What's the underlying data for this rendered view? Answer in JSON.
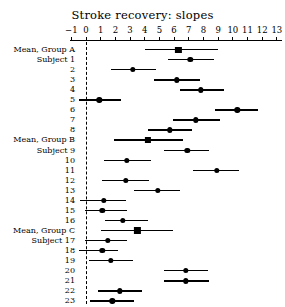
{
  "chart_data": {
    "type": "scatter",
    "title": "Stroke recovery: slopes",
    "subtitle": "",
    "xlabel": "",
    "ylabel": "",
    "xlim": [
      -1.6,
      13.6
    ],
    "xticks": [
      -1,
      0,
      1,
      2,
      3,
      4,
      5,
      6,
      7,
      8,
      9,
      10,
      11,
      12,
      13
    ],
    "xtick_labels": [
      "−1",
      "0",
      "1",
      "2",
      "3",
      "4",
      "5",
      "6",
      "7",
      "8",
      "9",
      "10",
      "11",
      "12",
      "13"
    ],
    "grid": false,
    "legend": false,
    "reference_line": {
      "value": 0,
      "style": "dashed",
      "color": "#000000"
    },
    "marker_colors": {
      "point": "#000000",
      "interval": "#000000"
    },
    "rows": [
      {
        "label": "Mean, Group A",
        "marker": "square",
        "estimate": 6.3,
        "low": 4.0,
        "high": 9.0
      },
      {
        "label": "Subject 1",
        "marker": "circle",
        "estimate": 7.1,
        "low": 5.6,
        "high": 8.7
      },
      {
        "label": "2",
        "marker": "circle",
        "estimate": 3.2,
        "low": 1.7,
        "high": 4.8
      },
      {
        "label": "3",
        "marker": "circle",
        "estimate": 6.2,
        "low": 4.6,
        "high": 7.8
      },
      {
        "label": "4",
        "marker": "circle",
        "estimate": 7.8,
        "low": 6.4,
        "high": 9.4
      },
      {
        "label": "5",
        "marker": "circle",
        "estimate": 0.9,
        "low": -0.5,
        "high": 2.4
      },
      {
        "label": "6",
        "marker": "circle",
        "estimate": 10.3,
        "low": 8.8,
        "high": 11.7
      },
      {
        "label": "7",
        "marker": "circle",
        "estimate": 7.5,
        "low": 5.9,
        "high": 9.1
      },
      {
        "label": "8",
        "marker": "circle",
        "estimate": 5.7,
        "low": 4.2,
        "high": 7.2
      },
      {
        "label": "Mean, Group B",
        "marker": "square",
        "estimate": 4.2,
        "low": 1.9,
        "high": 6.6
      },
      {
        "label": "Subject 9",
        "marker": "circle",
        "estimate": 6.9,
        "low": 5.3,
        "high": 8.4
      },
      {
        "label": "10",
        "marker": "circle",
        "estimate": 2.8,
        "low": 1.2,
        "high": 4.4
      },
      {
        "label": "11",
        "marker": "circle",
        "estimate": 8.9,
        "low": 7.3,
        "high": 10.4
      },
      {
        "label": "12",
        "marker": "circle",
        "estimate": 2.7,
        "low": 1.1,
        "high": 4.3
      },
      {
        "label": "13",
        "marker": "circle",
        "estimate": 4.9,
        "low": 3.3,
        "high": 6.4
      },
      {
        "label": "14",
        "marker": "circle",
        "estimate": 1.2,
        "low": -0.4,
        "high": 2.7
      },
      {
        "label": "15",
        "marker": "circle",
        "estimate": 1.1,
        "low": -0.1,
        "high": 2.8
      },
      {
        "label": "16",
        "marker": "circle",
        "estimate": 2.5,
        "low": 1.3,
        "high": 4.2
      },
      {
        "label": "Mean, Group C",
        "marker": "square",
        "estimate": 3.5,
        "low": 1.0,
        "high": 5.9
      },
      {
        "label": "Subject 17",
        "marker": "circle",
        "estimate": 1.5,
        "low": -0.1,
        "high": 2.8
      },
      {
        "label": "18",
        "marker": "circle",
        "estimate": 1.1,
        "low": -0.5,
        "high": 2.2
      },
      {
        "label": "19",
        "marker": "circle",
        "estimate": 1.7,
        "low": 0.2,
        "high": 3.2
      },
      {
        "label": "20",
        "marker": "circle",
        "estimate": 6.8,
        "low": 5.3,
        "high": 8.3
      },
      {
        "label": "21",
        "marker": "circle",
        "estimate": 6.8,
        "low": 5.3,
        "high": 8.4
      },
      {
        "label": "22",
        "marker": "circle",
        "estimate": 2.3,
        "low": 0.8,
        "high": 3.8
      },
      {
        "label": "23",
        "marker": "circle",
        "estimate": 1.8,
        "low": 0.3,
        "high": 3.3
      }
    ]
  }
}
